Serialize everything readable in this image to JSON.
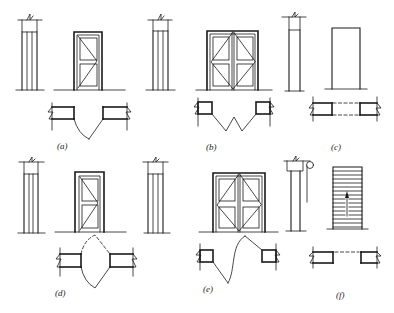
{
  "figure": {
    "panels": [
      {
        "id": "a",
        "label": "(a)",
        "type": "single-leaf swing door"
      },
      {
        "id": "b",
        "label": "(b)",
        "type": "double-leaf swing door"
      },
      {
        "id": "c",
        "label": "(c)",
        "type": "door opening (no leaf)"
      },
      {
        "id": "d",
        "label": "(d)",
        "type": "single-leaf double-acting door"
      },
      {
        "id": "e",
        "label": "(e)",
        "type": "double-leaf double-acting door"
      },
      {
        "id": "f",
        "label": "(f)",
        "type": "rolling shutter door"
      }
    ]
  },
  "colors": {
    "line": "#1a1a1a",
    "background": "#ffffff"
  }
}
